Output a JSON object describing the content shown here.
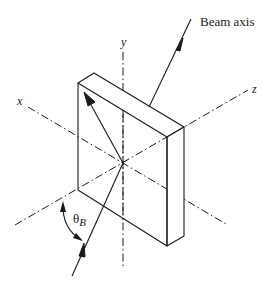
{
  "diagram": {
    "labels": {
      "beam_axis": "Beam axis",
      "y_axis": "y",
      "x_axis": "x",
      "z_axis": "z",
      "theta": "θ",
      "theta_sub": "B"
    },
    "colors": {
      "line": "#1a1a1a",
      "background": "#ffffff"
    }
  }
}
